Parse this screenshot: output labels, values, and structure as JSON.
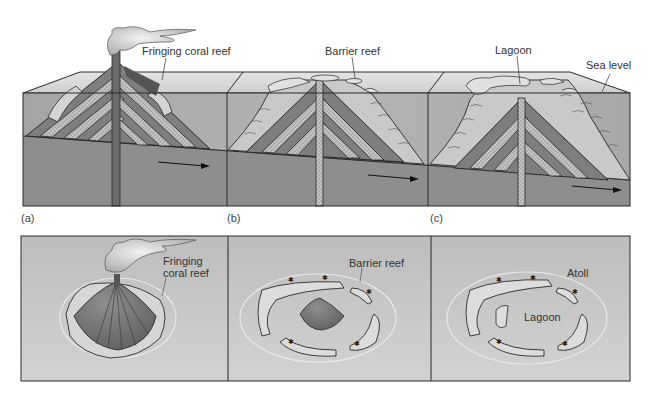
{
  "figure": {
    "top_row": {
      "description": "Cross-sections showing subsidence of a volcanic island and reef development",
      "panels": [
        {
          "id": "a",
          "tag": "(a)",
          "labels": [
            "Fringing coral reef"
          ]
        },
        {
          "id": "b",
          "tag": "(b)",
          "labels": [
            "Barrier reef"
          ]
        },
        {
          "id": "c",
          "tag": "(c)",
          "labels": [
            "Lagoon",
            "Sea level"
          ]
        }
      ]
    },
    "bottom_row": {
      "description": "Plan views of the three stages",
      "panels": [
        {
          "id": "a",
          "labels": [
            "Fringing",
            "coral reef"
          ]
        },
        {
          "id": "b",
          "labels": [
            "Barrier reef"
          ]
        },
        {
          "id": "c",
          "labels": [
            "Atoll",
            "Lagoon"
          ]
        }
      ]
    },
    "colors": {
      "water_front": "#a9a9a9",
      "water_top": "#d6d6d6",
      "seabed": "#8c8c8c",
      "volcanic_layer_dark": "#7a7a7a",
      "volcanic_layer_light": "#bdbdbd",
      "reef": "#dcdcdc",
      "plan_bg": "#c4c4c4",
      "outline": "#2a2a2a"
    }
  }
}
